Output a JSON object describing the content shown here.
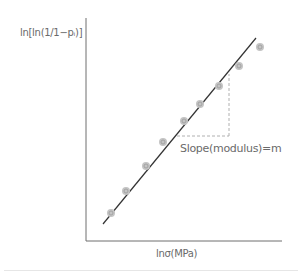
{
  "chart_data": {
    "type": "scatter",
    "title": "",
    "xlabel": "lnσ(MPa)",
    "ylabel": "ln[ln(1/1−pᵢ)]",
    "annotation": "Slope(modulus)=m",
    "grid": false,
    "legend": null,
    "ticks": {
      "x": [],
      "y": []
    },
    "series": [
      {
        "name": "data points",
        "marker": "circle",
        "points_px": [
          [
            111,
            213
          ],
          [
            126,
            191
          ],
          [
            146,
            166
          ],
          [
            163,
            142
          ],
          [
            184,
            121
          ],
          [
            200,
            104
          ],
          [
            219,
            86
          ],
          [
            239,
            66
          ],
          [
            260,
            47
          ]
        ]
      }
    ],
    "fit_line": {
      "name": "linear fit",
      "from_px": [
        103,
        224
      ],
      "to_px": [
        256,
        38
      ]
    },
    "slope_triangle": {
      "h_from_px": [
        177,
        136
      ],
      "corner_px": [
        229,
        136
      ],
      "v_to_px": [
        229,
        74
      ]
    },
    "axes": {
      "origin_px": [
        86,
        241
      ],
      "x_end_px": [
        282,
        241
      ],
      "y_end_px": [
        86,
        18
      ]
    }
  },
  "labels": {
    "ylabel": "ln[ln(1/1−pᵢ)]",
    "xlabel": "lnσ(MPa)",
    "slope": "Slope(modulus)=m"
  },
  "colors": {
    "axis": "#6e6e6e",
    "fit_line": "#333333",
    "point_fill": "#c4c4c4",
    "point_stroke": "#9a9a9a",
    "dashed": "#b0b0b0",
    "text": "#6a6a6a"
  }
}
